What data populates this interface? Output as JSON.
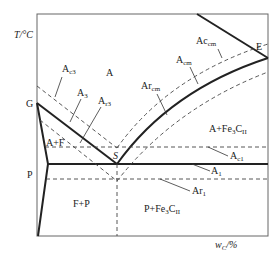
{
  "diagram": {
    "type": "Fe-Fe3C phase diagram (steel region) with critical temperature lines",
    "axes": {
      "y_label": "T/°C",
      "x_label": "w_C/%"
    },
    "points": {
      "G": "G",
      "P": "P",
      "S": "S",
      "E": "E"
    },
    "regions": {
      "austenite": "A",
      "austenite_ferrite": "A+F",
      "ferrite_pearlite": "F+P",
      "austenite_cementite": "A+Fe3CII",
      "pearlite_cementite": "P+Fe3CII"
    },
    "lines": {
      "Ac3": {
        "base": "A",
        "sub": "c3"
      },
      "A3": {
        "base": "A",
        "sub": "3"
      },
      "Ar3": {
        "base": "A",
        "sub": "r3"
      },
      "Accm": {
        "base": "Ac",
        "sub": "cm"
      },
      "Acm": {
        "base": "A",
        "sub": "cm"
      },
      "Arcm": {
        "base": "Ar",
        "sub": "cm"
      },
      "Ac1": {
        "base": "A",
        "sub": "c1"
      },
      "A1": {
        "base": "A",
        "sub": "1"
      },
      "Ar1": {
        "base": "Ar",
        "sub": "1"
      }
    },
    "colors": {
      "line": "#222222",
      "frame": "#555555"
    }
  }
}
